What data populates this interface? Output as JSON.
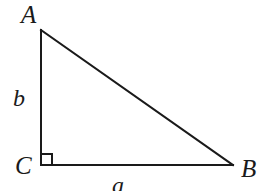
{
  "figure": {
    "kind": "right-triangle-diagram",
    "background_color": "#ffffff",
    "stroke_color": "#1a1a1a",
    "stroke_width": 2,
    "width": 264,
    "height": 191,
    "vertices": {
      "A": {
        "label": "A",
        "x": 41,
        "y": 30
      },
      "B": {
        "label": "B",
        "x": 233,
        "y": 165
      },
      "C": {
        "label": "C",
        "x": 41,
        "y": 165
      }
    },
    "sides": {
      "a": {
        "label": "a",
        "from": "C",
        "to": "B",
        "description": "base, horizontal leg opposite vertex A"
      },
      "b": {
        "label": "b",
        "from": "A",
        "to": "C",
        "description": "vertical leg opposite vertex B"
      },
      "c": {
        "label": "",
        "from": "A",
        "to": "B",
        "description": "hypotenuse, unlabeled"
      }
    },
    "right_angle": {
      "at_vertex": "C",
      "marker": "square",
      "size": 11
    },
    "polyline_points": "41,30 41,165 233,165 41,30"
  }
}
